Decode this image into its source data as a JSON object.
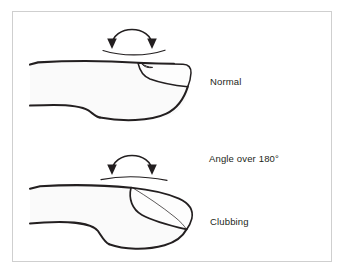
{
  "figure": {
    "background_color": "#ffffff",
    "border_color": "#cfcfcf",
    "ink_color": "#231f20",
    "finger_fill_color": "#fafafa"
  },
  "labels": {
    "normal": "Normal",
    "angle": "Angle over 180°",
    "clubbing": "Clubbing"
  },
  "panels": [
    {
      "name": "normal-finger",
      "label": "Normal",
      "description": "Side profile of a normal finger with a flat nail and nail-fold angle less than 180 degrees",
      "arrow": "curved-double-headed-arc"
    },
    {
      "name": "clubbed-finger",
      "label": "Clubbing",
      "annotation": "Angle over 180°",
      "description": "Side profile of a clubbed finger with a bulbous fingertip and convex nail, nail-fold angle greater than 180 degrees",
      "arrow": "curved-double-headed-arc"
    }
  ]
}
